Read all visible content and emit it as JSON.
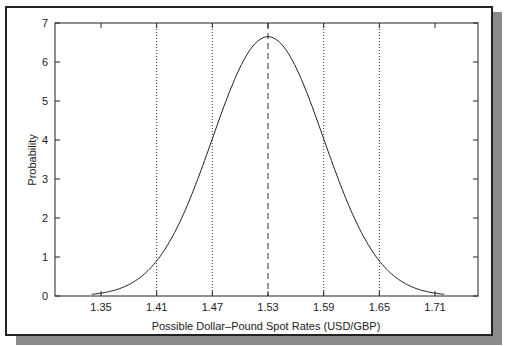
{
  "chart_data": {
    "type": "line",
    "title": "",
    "xlabel": "Possible Dollar–Pound Spot Rates (USD/GBP)",
    "ylabel": "Probability",
    "xlim": [
      1.3,
      1.755
    ],
    "ylim": [
      0,
      7
    ],
    "xticks": [
      "1.35",
      "1.41",
      "1.47",
      "1.53",
      "1.59",
      "1.65",
      "1.71"
    ],
    "yticks": [
      "0",
      "1",
      "2",
      "3",
      "4",
      "5",
      "6",
      "7"
    ],
    "grid": false,
    "legend": null,
    "series": [
      {
        "name": "Normal density (mean 1.53, sd 0.06)",
        "mean": 1.53,
        "sd": 0.06,
        "x": [
          1.34,
          1.35,
          1.37,
          1.39,
          1.41,
          1.43,
          1.45,
          1.47,
          1.49,
          1.51,
          1.53,
          1.55,
          1.57,
          1.59,
          1.61,
          1.63,
          1.65,
          1.67,
          1.69,
          1.71,
          1.72
        ],
        "y": [
          0.04,
          0.07,
          0.19,
          0.44,
          0.9,
          1.65,
          2.73,
          4.03,
          5.32,
          6.29,
          6.65,
          6.29,
          5.32,
          4.03,
          2.73,
          1.65,
          0.9,
          0.44,
          0.19,
          0.07,
          0.04
        ]
      }
    ],
    "annotations": [
      {
        "type": "vline",
        "x": 1.53,
        "style": "dashed",
        "label": "mean"
      },
      {
        "type": "vline",
        "x": 1.47,
        "style": "dotted",
        "label": "-1 sd"
      },
      {
        "type": "vline",
        "x": 1.59,
        "style": "dotted",
        "label": "+1 sd"
      },
      {
        "type": "vline",
        "x": 1.41,
        "style": "dotted",
        "label": "-2 sd"
      },
      {
        "type": "vline",
        "x": 1.65,
        "style": "dotted",
        "label": "+2 sd"
      }
    ]
  },
  "colors": {
    "line": "#222222",
    "frame": "#222222",
    "shadow": "#8a8a8a"
  }
}
